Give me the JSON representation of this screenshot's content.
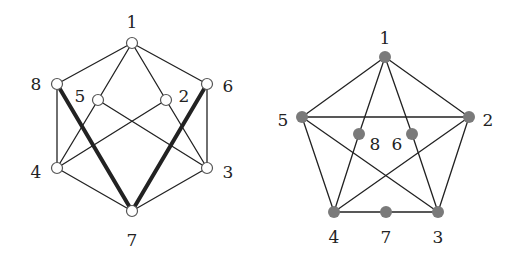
{
  "colors": {
    "edge": "#222222",
    "node_open_fill": "#ffffff",
    "node_open_stroke": "#555555",
    "node_filled": "#7a7a7a",
    "label": "#222222"
  },
  "graphs": [
    {
      "name": "left-graph",
      "node_style": "open",
      "nodes": [
        {
          "id": "1",
          "x": 132,
          "y": 43,
          "lx": 132,
          "ly": 28
        },
        {
          "id": "8",
          "x": 57,
          "y": 84,
          "lx": 36,
          "ly": 90
        },
        {
          "id": "5",
          "x": 98,
          "y": 100,
          "lx": 80,
          "ly": 102
        },
        {
          "id": "2",
          "x": 166,
          "y": 100,
          "lx": 184,
          "ly": 102
        },
        {
          "id": "6",
          "x": 207,
          "y": 84,
          "lx": 228,
          "ly": 92
        },
        {
          "id": "4",
          "x": 57,
          "y": 168,
          "lx": 36,
          "ly": 178
        },
        {
          "id": "3",
          "x": 207,
          "y": 168,
          "lx": 228,
          "ly": 178
        },
        {
          "id": "7",
          "x": 132,
          "y": 211,
          "lx": 132,
          "ly": 246
        }
      ],
      "edges": [
        {
          "from": "1",
          "to": "8",
          "thick": false
        },
        {
          "from": "1",
          "to": "6",
          "thick": false
        },
        {
          "from": "1",
          "to": "5",
          "thick": false
        },
        {
          "from": "1",
          "to": "2",
          "thick": false
        },
        {
          "from": "8",
          "to": "4",
          "thick": false
        },
        {
          "from": "6",
          "to": "3",
          "thick": false
        },
        {
          "from": "5",
          "to": "4",
          "thick": false
        },
        {
          "from": "5",
          "to": "3",
          "thick": false
        },
        {
          "from": "2",
          "to": "4",
          "thick": false
        },
        {
          "from": "2",
          "to": "3",
          "thick": false
        },
        {
          "from": "4",
          "to": "7",
          "thick": false
        },
        {
          "from": "3",
          "to": "7",
          "thick": false
        },
        {
          "from": "8",
          "to": "7",
          "thick": true
        },
        {
          "from": "6",
          "to": "7",
          "thick": true
        }
      ]
    },
    {
      "name": "right-graph",
      "node_style": "filled",
      "nodes": [
        {
          "id": "1",
          "x": 385,
          "y": 57,
          "lx": 385,
          "ly": 44
        },
        {
          "id": "5",
          "x": 302,
          "y": 117,
          "lx": 283,
          "ly": 126
        },
        {
          "id": "2",
          "x": 469,
          "y": 117,
          "lx": 488,
          "ly": 126
        },
        {
          "id": "8",
          "x": 359,
          "y": 134,
          "lx": 375,
          "ly": 150
        },
        {
          "id": "6",
          "x": 412,
          "y": 134,
          "lx": 397,
          "ly": 150
        },
        {
          "id": "4",
          "x": 334,
          "y": 212,
          "lx": 334,
          "ly": 243
        },
        {
          "id": "7",
          "x": 386,
          "y": 212,
          "lx": 386,
          "ly": 243
        },
        {
          "id": "3",
          "x": 438,
          "y": 212,
          "lx": 438,
          "ly": 243
        }
      ],
      "edges": [
        {
          "from": "1",
          "to": "5",
          "thick": false
        },
        {
          "from": "1",
          "to": "2",
          "thick": false
        },
        {
          "from": "1",
          "to": "8",
          "thick": false
        },
        {
          "from": "1",
          "to": "6",
          "thick": false
        },
        {
          "from": "5",
          "to": "2",
          "thick": false
        },
        {
          "from": "5",
          "to": "4",
          "thick": false
        },
        {
          "from": "5",
          "to": "3",
          "thick": false
        },
        {
          "from": "2",
          "to": "4",
          "thick": false
        },
        {
          "from": "2",
          "to": "3",
          "thick": false
        },
        {
          "from": "8",
          "to": "4",
          "thick": false
        },
        {
          "from": "6",
          "to": "3",
          "thick": false
        },
        {
          "from": "4",
          "to": "7",
          "thick": false
        },
        {
          "from": "7",
          "to": "3",
          "thick": false
        }
      ]
    }
  ]
}
